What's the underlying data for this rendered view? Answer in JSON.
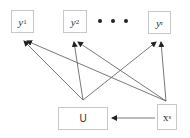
{
  "diagram": {
    "nodes": [
      {
        "id": "y1",
        "base": "y",
        "sub": "1",
        "italic": true
      },
      {
        "id": "y2",
        "base": "y",
        "sub": "2",
        "italic": true
      },
      {
        "id": "yr",
        "base": "y",
        "sub": "r",
        "italic": true
      },
      {
        "id": "U",
        "base": "U",
        "sub": "",
        "italic": false
      },
      {
        "id": "xs",
        "base": "x",
        "sub": "s",
        "italic": false
      }
    ],
    "ellipsis": "• • •",
    "edges": [
      {
        "from": "U",
        "to": "y1"
      },
      {
        "from": "U",
        "to": "y2"
      },
      {
        "from": "U",
        "to": "yr"
      },
      {
        "from": "xs",
        "to": "y1"
      },
      {
        "from": "xs",
        "to": "y2"
      },
      {
        "from": "xs",
        "to": "yr"
      },
      {
        "from": "xs",
        "to": "U"
      }
    ]
  }
}
